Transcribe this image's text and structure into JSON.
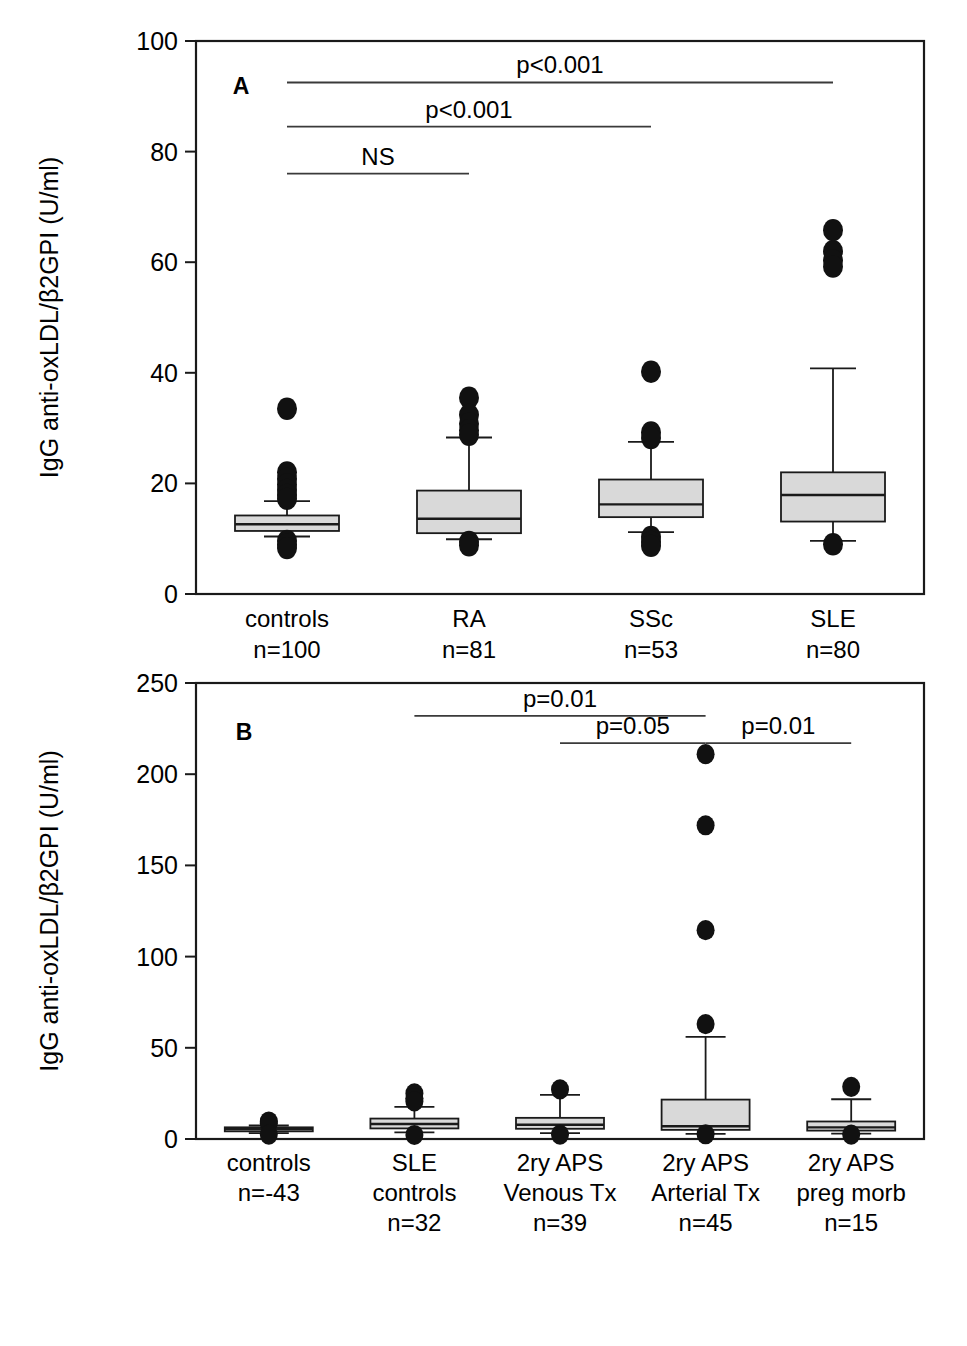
{
  "figure": {
    "panels": [
      "A",
      "B"
    ],
    "y_axis_title": "IgG anti-oxLDL/β2GPI (U/ml)"
  },
  "panel_a": {
    "letter": "A",
    "categories": [
      {
        "name": "controls",
        "n": "n=100"
      },
      {
        "name": "RA",
        "n": "n=81"
      },
      {
        "name": "SSc",
        "n": "n=53"
      },
      {
        "name": "SLE",
        "n": "n=80"
      }
    ],
    "significance": [
      {
        "label": "NS",
        "from": 0,
        "to": 1,
        "y": 76
      },
      {
        "label": "p<0.001",
        "from": 0,
        "to": 2,
        "y": 84.5
      },
      {
        "label": "p<0.001",
        "from": 0,
        "to": 3,
        "y": 92.5
      }
    ]
  },
  "panel_b": {
    "letter": "B",
    "categories": [
      {
        "name": "controls",
        "n": "n=-43"
      },
      {
        "name": "SLE controls",
        "n": "n=32"
      },
      {
        "name": "2ry APS Venous Tx",
        "n": "n=39"
      },
      {
        "name": "2ry APS Arterial Tx",
        "n": "n=45"
      },
      {
        "name": "2ry APS preg morb",
        "n": "n=15"
      }
    ],
    "significance": [
      {
        "label": "p=0.01",
        "from": 1,
        "to": 3,
        "y": 232
      },
      {
        "label": "p=0.05",
        "from": 2,
        "to": 3,
        "y": 217
      },
      {
        "label": "p=0.01",
        "from": 3,
        "to": 4,
        "y": 217
      }
    ]
  },
  "chart_data": [
    {
      "type": "box",
      "panel": "A",
      "title": "A",
      "xlabel": "",
      "ylabel": "IgG anti-oxLDL/β2GPI (U/ml)",
      "ylim": [
        0,
        100
      ],
      "yticks": [
        0,
        20,
        40,
        60,
        80,
        100
      ],
      "grid": false,
      "legend": "none",
      "categories": [
        "controls",
        "RA",
        "SSc",
        "SLE"
      ],
      "group_sizes": [
        "n=100",
        "n=81",
        "n=53",
        "n=80"
      ],
      "boxes": [
        {
          "category": "controls",
          "whisker_low": 10.4,
          "q1": 11.4,
          "median": 12.6,
          "q3": 14.2,
          "whisker_high": 16.8,
          "outliers": [
            33.5,
            22.0,
            20.8,
            19.8,
            18.8,
            17.9,
            17.2,
            9.6,
            8.9,
            8.3
          ]
        },
        {
          "category": "RA",
          "whisker_low": 9.9,
          "q1": 11.0,
          "median": 13.6,
          "q3": 18.7,
          "whisker_high": 28.3,
          "outliers": [
            35.5,
            32.4,
            30.8,
            29.6,
            28.8,
            9.4,
            8.8
          ]
        },
        {
          "category": "SSc",
          "whisker_low": 11.2,
          "q1": 13.9,
          "median": 16.2,
          "q3": 20.7,
          "whisker_high": 27.5,
          "outliers": [
            40.2,
            29.2,
            28.2,
            10.3,
            9.4,
            8.7
          ]
        },
        {
          "category": "SLE",
          "whisker_low": 9.6,
          "q1": 13.1,
          "median": 17.9,
          "q3": 22.0,
          "whisker_high": 40.8,
          "outliers": [
            65.8,
            62.0,
            60.3,
            59.2,
            9.0
          ]
        }
      ],
      "annotations": [
        {
          "text": "NS",
          "groups": [
            "controls",
            "RA"
          ],
          "y": 76
        },
        {
          "text": "p<0.001",
          "groups": [
            "controls",
            "SSc"
          ],
          "y": 84.5
        },
        {
          "text": "p<0.001",
          "groups": [
            "controls",
            "SLE"
          ],
          "y": 92.5
        }
      ]
    },
    {
      "type": "box",
      "panel": "B",
      "title": "B",
      "xlabel": "",
      "ylabel": "IgG anti-oxLDL/β2GPI (U/ml)",
      "ylim": [
        0,
        250
      ],
      "yticks": [
        0,
        50,
        100,
        150,
        200,
        250
      ],
      "grid": false,
      "legend": "none",
      "categories": [
        "controls",
        "SLE controls",
        "2ry APS Venous Tx",
        "2ry APS Arterial Tx",
        "2ry APS preg morb"
      ],
      "group_sizes": [
        "n=-43",
        "n=32",
        "n=39",
        "n=45",
        "n=15"
      ],
      "boxes": [
        {
          "category": "controls",
          "whisker_low": 3.2,
          "q1": 4.2,
          "median": 5.4,
          "q3": 6.4,
          "whisker_high": 7.4,
          "outliers": [
            9.6,
            8.6,
            2.4
          ]
        },
        {
          "category": "SLE controls",
          "whisker_low": 3.6,
          "q1": 5.8,
          "median": 8.2,
          "q3": 11.2,
          "whisker_high": 17.6,
          "outliers": [
            25.0,
            22.4,
            20.6,
            2.2
          ]
        },
        {
          "category": "2ry APS Venous Tx",
          "whisker_low": 3.2,
          "q1": 5.6,
          "median": 7.8,
          "q3": 11.6,
          "whisker_high": 24.2,
          "outliers": [
            27.2,
            2.4
          ]
        },
        {
          "category": "2ry APS Arterial Tx",
          "whisker_low": 2.8,
          "q1": 5.0,
          "median": 7.0,
          "q3": 21.6,
          "whisker_high": 56.0,
          "outliers": [
            211.0,
            172.0,
            114.5,
            63.0,
            2.6
          ]
        },
        {
          "category": "2ry APS preg morb",
          "whisker_low": 3.0,
          "q1": 4.6,
          "median": 6.4,
          "q3": 9.6,
          "whisker_high": 21.8,
          "outliers": [
            28.6,
            2.4
          ]
        }
      ],
      "annotations": [
        {
          "text": "p=0.01",
          "groups": [
            "SLE controls",
            "2ry APS Arterial Tx"
          ],
          "y": 232
        },
        {
          "text": "p=0.05",
          "groups": [
            "2ry APS Venous Tx",
            "2ry APS Arterial Tx"
          ],
          "y": 217
        },
        {
          "text": "p=0.01",
          "groups": [
            "2ry APS Arterial Tx",
            "2ry APS preg morb"
          ],
          "y": 217
        }
      ]
    }
  ]
}
